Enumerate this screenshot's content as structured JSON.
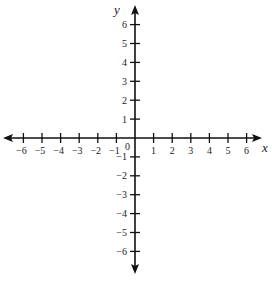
{
  "chart_data": {
    "type": "coordinate-plane",
    "title": "",
    "xlabel": "x",
    "ylabel": "y",
    "xlim": [
      -6,
      6
    ],
    "ylim": [
      -6,
      6
    ],
    "x_ticks": [
      -6,
      -5,
      -4,
      -3,
      -2,
      -1,
      1,
      2,
      3,
      4,
      5,
      6
    ],
    "y_ticks": [
      6,
      5,
      4,
      3,
      2,
      1,
      -1,
      -2,
      -3,
      -4,
      -5,
      -6
    ],
    "x_tick_labels": [
      "−6",
      "−5",
      "−4",
      "−3",
      "−2",
      "−1",
      "1",
      "2",
      "3",
      "4",
      "5",
      "6"
    ],
    "y_tick_labels": [
      "6",
      "5",
      "4",
      "3",
      "2",
      "1",
      "−1",
      "−2",
      "−3",
      "−4",
      "−5",
      "−6"
    ],
    "origin_label": "0",
    "grid": false,
    "arrows": true,
    "series": []
  },
  "colors": {
    "axis": "#111111",
    "text": "#222222",
    "background": "#ffffff"
  }
}
